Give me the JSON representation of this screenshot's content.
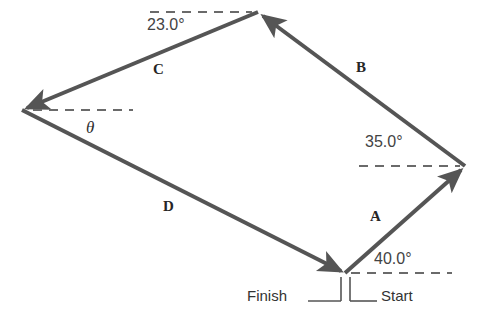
{
  "figure": {
    "type": "vector-addition-diagram",
    "stroke_color": "#555555",
    "dashed_color": "#6a6a6a",
    "background": "#ffffff"
  },
  "vectors": [
    {
      "id": "A",
      "label": "A",
      "label_x": 370,
      "label_y": 209,
      "from": [
        345,
        273
      ],
      "to": [
        465,
        166
      ],
      "angle_text": "40.0°",
      "angle_value": 40.0
    },
    {
      "id": "B",
      "label": "B",
      "label_x": 356,
      "label_y": 60,
      "from": [
        465,
        166
      ],
      "to": [
        258,
        12
      ],
      "angle_text": "35.0°",
      "angle_value": 35.0
    },
    {
      "id": "C",
      "label": "C",
      "label_x": 153,
      "label_y": 62,
      "from": [
        258,
        12
      ],
      "to": [
        22,
        110
      ],
      "angle_text": "23.0°",
      "angle_value": 23.0
    },
    {
      "id": "D",
      "label": "D",
      "label_x": 163,
      "label_y": 199,
      "from": [
        22,
        110
      ],
      "to": [
        345,
        273
      ],
      "angle_text": "θ",
      "angle_value": null
    }
  ],
  "angle_labels": [
    {
      "name": "angle-23",
      "text": "23.0°",
      "x": 147,
      "y": 17
    },
    {
      "name": "angle-35",
      "text": "35.0°",
      "x": 365,
      "y": 134
    },
    {
      "name": "angle-40",
      "text": "40.0°",
      "x": 374,
      "y": 251
    },
    {
      "name": "angle-theta",
      "text": "θ",
      "x": 86,
      "y": 119
    }
  ],
  "endpoints": {
    "start_label": "Start",
    "start_x": 381,
    "start_y": 288,
    "finish_label": "Finish",
    "finish_x": 247,
    "finish_y": 288,
    "vertex": [
      345,
      273
    ]
  },
  "reference_lines": [
    {
      "name": "dashed-ref-top",
      "x1": 150,
      "y1": 12,
      "x2": 252,
      "y2": 12
    },
    {
      "name": "dashed-ref-left",
      "x1": 33,
      "y1": 110,
      "x2": 133,
      "y2": 110
    },
    {
      "name": "dashed-ref-right",
      "x1": 359,
      "y1": 166,
      "x2": 460,
      "y2": 166
    },
    {
      "name": "dashed-ref-bottom",
      "x1": 351,
      "y1": 273,
      "x2": 452,
      "y2": 273
    }
  ]
}
